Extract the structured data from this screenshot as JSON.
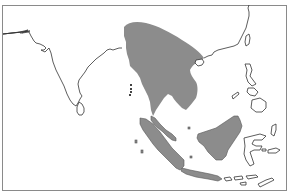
{
  "map": {
    "region": "South and Southeast Asia",
    "colors": {
      "background": "#ffffff",
      "frame": "#8a8a8a",
      "coastline": "#333333",
      "range_fill": "#8c8c8c"
    },
    "features": [
      {
        "name": "India",
        "type": "coastline"
      },
      {
        "name": "Sri Lanka",
        "type": "island"
      },
      {
        "name": "Bay of Bengal coast",
        "type": "coastline"
      },
      {
        "name": "Andaman Islands",
        "type": "island"
      },
      {
        "name": "Mainland Southeast Asia",
        "type": "shaded-range"
      },
      {
        "name": "Malay Peninsula",
        "type": "shaded-range"
      },
      {
        "name": "Sumatra",
        "type": "shaded-range"
      },
      {
        "name": "Java",
        "type": "shaded-range"
      },
      {
        "name": "Borneo",
        "type": "shaded-range"
      },
      {
        "name": "South China coast",
        "type": "coastline"
      },
      {
        "name": "Hainan",
        "type": "island"
      },
      {
        "name": "Taiwan",
        "type": "island"
      },
      {
        "name": "Philippines",
        "type": "island"
      },
      {
        "name": "Sulawesi",
        "type": "island"
      },
      {
        "name": "Lesser Sunda Islands",
        "type": "island"
      },
      {
        "name": "Moluccas",
        "type": "island"
      }
    ]
  }
}
